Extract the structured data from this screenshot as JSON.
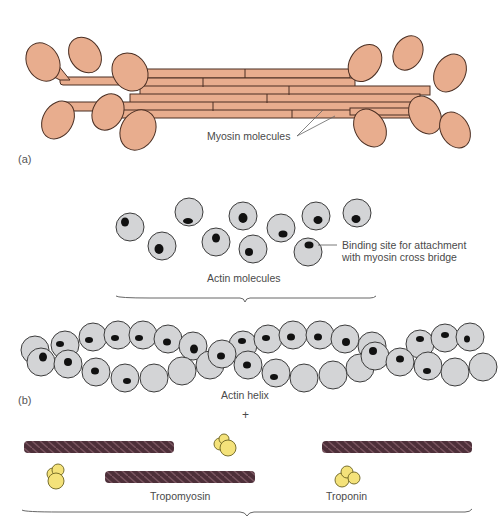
{
  "panels": {
    "a": {
      "label": "(a)",
      "myosin_label": "Myosin molecules"
    },
    "b": {
      "label": "(b)",
      "actin_molecules_label": "Actin molecules",
      "binding_site_label_line1": "Binding site for attachment",
      "binding_site_label_line2": "with myosin cross bridge",
      "actin_helix_label": "Actin helix",
      "plus_sign": "+",
      "tropomyosin_label": "Tropomyosin",
      "troponin_label": "Troponin"
    }
  },
  "colors": {
    "myosin_fill": "#e8ad8e",
    "myosin_stroke": "#4a2e22",
    "actin_fill": "#d3d4d6",
    "actin_stroke": "#3c3c3c",
    "binding_site": "#111111",
    "tropomyosin": "#5a3a44",
    "troponin_fill": "#f4e27a",
    "troponin_stroke": "#6b6220",
    "label_text": "#4a4a4a"
  }
}
